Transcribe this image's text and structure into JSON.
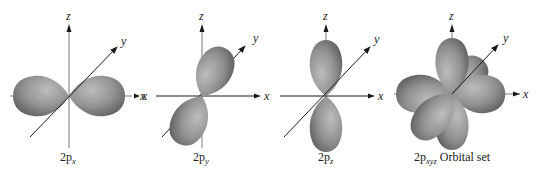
{
  "diagram": {
    "panels": [
      {
        "id": "2px",
        "caption_main": "2p",
        "caption_sub": "x",
        "caption_suffix": "",
        "axes": {
          "z": "z",
          "y": "y",
          "x": "x"
        }
      },
      {
        "id": "2py",
        "caption_main": "2p",
        "caption_sub": "y",
        "caption_suffix": "",
        "axes": {
          "z": "z",
          "y": "y",
          "x": "x",
          "x_neg": "x"
        }
      },
      {
        "id": "2pz",
        "caption_main": "2p",
        "caption_sub": "z",
        "caption_suffix": "",
        "axes": {
          "z": "z",
          "y": "y",
          "x": "x"
        }
      },
      {
        "id": "2pxyz",
        "caption_main": "2p",
        "caption_sub": "xyz",
        "caption_suffix": " Orbital set",
        "axes": {
          "z": "z",
          "y": "y",
          "x": "x"
        }
      }
    ],
    "colors": {
      "lobe_light": "#b4b4b4",
      "lobe_mid": "#8c8c8c",
      "lobe_dark": "#5e5e5e",
      "axis": "#1a1a1a",
      "axis_gray": "#7a7a7a"
    }
  }
}
